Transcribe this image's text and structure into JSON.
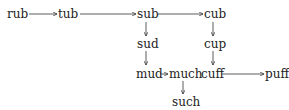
{
  "diagram": {
    "words": {
      "rub": "rub",
      "tub": "tub",
      "sub": "sub",
      "cub": "cub",
      "sud": "sud",
      "cup": "cup",
      "mud": "mud",
      "much": "much",
      "cuff": "cuff",
      "puff": "puff",
      "such": "such"
    },
    "edges": [
      [
        "rub",
        "tub"
      ],
      [
        "tub",
        "sub"
      ],
      [
        "sub",
        "cub"
      ],
      [
        "sub",
        "sud"
      ],
      [
        "cub",
        "cup"
      ],
      [
        "sud",
        "mud"
      ],
      [
        "cup",
        "cuff"
      ],
      [
        "mud",
        "much"
      ],
      [
        "cuff",
        "puff"
      ],
      [
        "much",
        "such"
      ]
    ],
    "line_color": "#333333"
  }
}
